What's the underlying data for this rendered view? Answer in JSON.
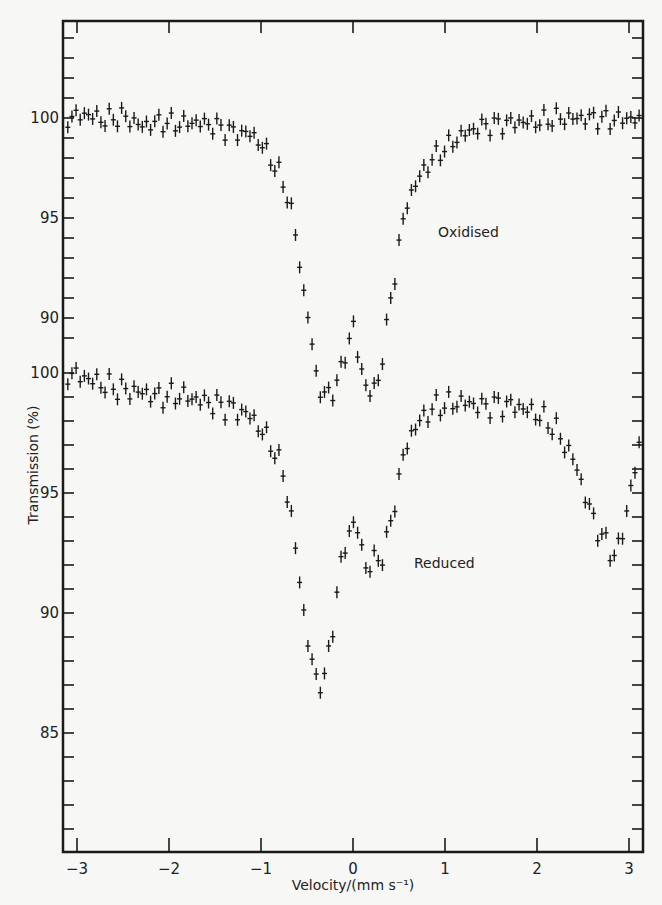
{
  "chart_data": {
    "type": "scatter",
    "title": "",
    "xlabel": "Velocity/(mm s⁻¹)",
    "ylabel": "Transmission (%)",
    "xlim": [
      -3.2,
      3.2
    ],
    "x_ticks": [
      -3,
      -2,
      -1,
      0,
      1,
      2,
      3
    ],
    "x_tick_labels": [
      "−3",
      "−2",
      "−1",
      "0",
      "1",
      "2",
      "3"
    ],
    "grid": false,
    "legend": "none (inline labels)",
    "stacked_offset_panels": true,
    "series": [
      {
        "name": "Oxidised",
        "label_position": {
          "x": 0.7,
          "y": 96.1
        },
        "y_axis": {
          "ticks": [
            100,
            95,
            90
          ],
          "minor_step": 1,
          "range_shown": [
            86,
            104
          ]
        },
        "x": [
          -3.1,
          -2.9,
          -2.7,
          -2.5,
          -2.3,
          -2.1,
          -1.9,
          -1.7,
          -1.5,
          -1.3,
          -1.1,
          -1.0,
          -0.9,
          -0.8,
          -0.75,
          -0.7,
          -0.65,
          -0.6,
          -0.55,
          -0.5,
          -0.47,
          -0.44,
          -0.4,
          -0.35,
          -0.3,
          -0.2,
          -0.1,
          0.0,
          0.05,
          0.1,
          0.15,
          0.2,
          0.25,
          0.3,
          0.35,
          0.4,
          0.45,
          0.5,
          0.55,
          0.6,
          0.7,
          0.8,
          0.9,
          1.0,
          1.2,
          1.4,
          1.6,
          1.8,
          2.0,
          2.2,
          2.4,
          2.6,
          2.8,
          3.0,
          3.15
        ],
        "values": [
          100.0,
          100.2,
          99.9,
          100.1,
          99.6,
          99.8,
          99.7,
          99.8,
          99.6,
          99.3,
          99.2,
          98.7,
          98.0,
          97.2,
          96.6,
          95.9,
          95.0,
          93.4,
          91.6,
          90.4,
          89.8,
          88.3,
          87.2,
          86.4,
          86.0,
          86.5,
          87.8,
          89.8,
          88.2,
          87.2,
          86.6,
          86.2,
          86.4,
          87.6,
          88.9,
          90.7,
          92.0,
          93.6,
          95.0,
          95.9,
          96.9,
          97.6,
          98.1,
          98.5,
          99.2,
          99.6,
          99.7,
          99.8,
          99.8,
          100.0,
          100.0,
          100.0,
          99.9,
          100.0,
          99.8
        ]
      },
      {
        "name": "Reduced",
        "label_position": {
          "x": 0.7,
          "y": 92.1
        },
        "y_axis": {
          "ticks": [
            100,
            95,
            90,
            85
          ],
          "minor_step": 1,
          "range_shown": [
            80.5,
            100.5
          ]
        },
        "x": [
          -3.1,
          -2.9,
          -2.7,
          -2.5,
          -2.3,
          -2.1,
          -1.9,
          -1.7,
          -1.5,
          -1.3,
          -1.1,
          -1.0,
          -0.9,
          -0.85,
          -0.8,
          -0.75,
          -0.7,
          -0.65,
          -0.6,
          -0.55,
          -0.5,
          -0.45,
          -0.4,
          -0.35,
          -0.3,
          -0.25,
          -0.2,
          -0.15,
          -0.1,
          -0.05,
          0.0,
          0.05,
          0.1,
          0.15,
          0.2,
          0.25,
          0.3,
          0.35,
          0.4,
          0.45,
          0.5,
          0.55,
          0.6,
          0.7,
          0.8,
          0.9,
          1.0,
          1.2,
          1.4,
          1.6,
          1.8,
          2.0,
          2.2,
          2.3,
          2.4,
          2.5,
          2.6,
          2.7,
          2.8,
          2.85,
          2.9,
          2.95,
          3.0,
          3.1,
          3.15
        ],
        "values": [
          100.0,
          99.8,
          99.5,
          99.3,
          99.2,
          99.0,
          99.1,
          98.9,
          98.7,
          98.5,
          98.2,
          97.6,
          97.1,
          96.7,
          96.2,
          95.8,
          94.6,
          93.4,
          92.1,
          90.4,
          89.0,
          88.0,
          87.3,
          87.1,
          87.3,
          88.7,
          90.1,
          91.5,
          92.6,
          93.4,
          93.6,
          93.5,
          92.6,
          91.8,
          92.0,
          92.3,
          92.3,
          92.6,
          93.6,
          94.6,
          95.5,
          96.6,
          97.2,
          97.9,
          98.3,
          98.6,
          98.7,
          98.8,
          98.6,
          98.7,
          98.6,
          98.3,
          97.7,
          97.0,
          96.4,
          95.2,
          94.0,
          93.2,
          92.6,
          92.4,
          92.9,
          93.6,
          94.9,
          96.6,
          97.8
        ]
      }
    ]
  },
  "axes": {
    "x_label": "Velocity/(mm s⁻¹)",
    "y_label": "Transmission (%)",
    "y_tick_labels_oxidised": [
      "100",
      "95",
      "90"
    ],
    "y_tick_labels_reduced": [
      "100",
      "95",
      "90",
      "85"
    ]
  },
  "labels": {
    "oxidised": "Oxidised",
    "reduced": "Reduced"
  },
  "colors": {
    "ink": "#1a1a1a",
    "paper": "#f7f7f5"
  }
}
